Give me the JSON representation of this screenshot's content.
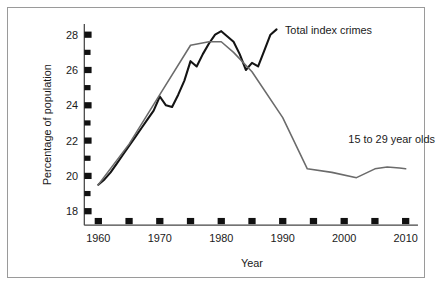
{
  "chart_data": {
    "type": "line",
    "title": "",
    "xlabel": "Year",
    "ylabel": "Percentage of population",
    "xlim": [
      1958,
      2012
    ],
    "ylim": [
      17.4,
      28.6
    ],
    "grid": false,
    "legend_position": "inline-annotations",
    "x_ticks_major": [
      1960,
      1970,
      1980,
      1990,
      2000,
      2010
    ],
    "x_ticks_all": [
      1960,
      1965,
      1970,
      1975,
      1980,
      1985,
      1990,
      1995,
      2000,
      2005,
      2010
    ],
    "x_tick_labels": [
      "1960",
      "1970",
      "1980",
      "1990",
      "2000",
      "2010"
    ],
    "y_ticks_major": [
      18,
      20,
      22,
      24,
      26,
      28
    ],
    "y_ticks_all": [
      18,
      19,
      20,
      21,
      22,
      23,
      24,
      25,
      26,
      27,
      28
    ],
    "y_tick_labels": [
      "18",
      "20",
      "22",
      "24",
      "26",
      "28"
    ],
    "series": [
      {
        "name": "Total index crimes",
        "color": "#141414",
        "label_x": 1989,
        "label_y": 28.3,
        "x": [
          1960,
          1961,
          1962,
          1963,
          1964,
          1965,
          1966,
          1967,
          1968,
          1969,
          1970,
          1971,
          1972,
          1973,
          1974,
          1975,
          1976,
          1977,
          1978,
          1979,
          1980,
          1981,
          1982,
          1983,
          1984,
          1985,
          1986,
          1987,
          1988,
          1989
        ],
        "values": [
          19.5,
          19.8,
          20.2,
          20.7,
          21.2,
          21.7,
          22.2,
          22.7,
          23.2,
          23.7,
          24.5,
          24.0,
          23.9,
          24.6,
          25.4,
          26.5,
          26.2,
          26.9,
          27.5,
          28.0,
          28.2,
          27.9,
          27.6,
          26.9,
          26.0,
          26.4,
          26.2,
          27.1,
          28.0,
          28.3
        ]
      },
      {
        "name": "15 to 29 year olds",
        "color": "#6b6b6b",
        "label_x": 2000,
        "label_y": 22.1,
        "x": [
          1960,
          1965,
          1970,
          1975,
          1978,
          1980,
          1982,
          1985,
          1990,
          1994,
          1998,
          2002,
          2005,
          2007,
          2009,
          2010
        ],
        "values": [
          19.5,
          21.8,
          24.6,
          27.4,
          27.6,
          27.6,
          27.0,
          25.9,
          23.3,
          20.4,
          20.2,
          19.9,
          20.4,
          20.5,
          20.45,
          20.4
        ]
      }
    ]
  },
  "axis": {
    "x_title": "Year",
    "y_title": "Percentage of population"
  }
}
